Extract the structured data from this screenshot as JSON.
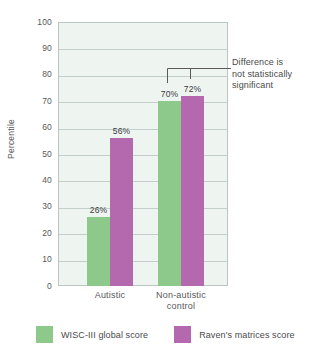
{
  "chart_data": {
    "type": "bar",
    "title": "",
    "subtitle": "",
    "xlabel": "",
    "ylabel": "Percentile",
    "ylim": [
      0,
      100
    ],
    "ytick_step": 10,
    "grid": true,
    "legend_position": "bottom",
    "categories": [
      "Autistic",
      "Non-autistic control"
    ],
    "series": [
      {
        "name": "WISC-III global score",
        "color": "#8cc98a",
        "values": [
          26,
          70
        ],
        "labels": [
          "26%",
          "70%"
        ]
      },
      {
        "name": "Raven's matrices score",
        "color": "#b468ae",
        "values": [
          56,
          72
        ],
        "labels": [
          "56%",
          "72%"
        ]
      }
    ],
    "ytick_labels": [
      "100",
      "90",
      "80",
      "70",
      "60",
      "50",
      "40",
      "30",
      "20",
      "10",
      "0"
    ],
    "category_labels": [
      {
        "line1": "Autistic",
        "line2": ""
      },
      {
        "line1": "Non-autistic",
        "line2": "control"
      }
    ],
    "annotations": [
      {
        "name": "significance-note",
        "line1": "Difference is",
        "line2": "not statistically",
        "line3": "significant",
        "targets": [
          "Non-autistic control / WISC-III global score",
          "Non-autistic control / Raven's matrices score"
        ]
      }
    ],
    "colors": {
      "series_1": "#8cc98a",
      "series_2": "#b468ae",
      "plot_background": "#eef5f1",
      "gridline": "#c3cfcb",
      "plot_border": "#b9c6c2",
      "text": "#58585a",
      "annotation_line": "#5a5a5c"
    }
  }
}
